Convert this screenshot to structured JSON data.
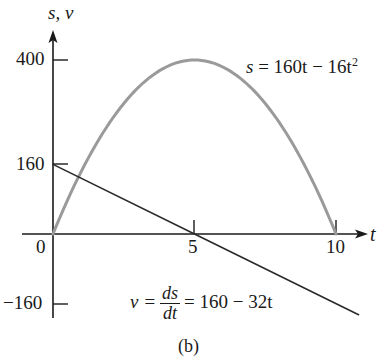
{
  "chart_data": {
    "type": "line",
    "title": "",
    "caption": "(b)",
    "xlabel": "t",
    "ylabel": "s, v",
    "xlim": [
      0,
      11
    ],
    "ylim": [
      -180,
      420
    ],
    "grid": false,
    "x_ticks": [
      0,
      5,
      10
    ],
    "y_ticks": [
      400,
      160,
      0,
      -160
    ],
    "x_tick_labels": [
      "0",
      "5",
      "10"
    ],
    "y_tick_labels": [
      "400",
      "160",
      "-160"
    ],
    "series": [
      {
        "name": "s = 160t - 16t^2",
        "kind": "curve",
        "color": "#9a9a9a",
        "x": [
          0,
          1,
          2,
          3,
          4,
          5,
          6,
          7,
          8,
          9,
          10
        ],
        "values": [
          0,
          144,
          256,
          336,
          384,
          400,
          384,
          336,
          256,
          144,
          0
        ]
      },
      {
        "name": "v = ds/dt = 160 - 32t",
        "kind": "line",
        "color": "#2a2a2a",
        "x": [
          0,
          5,
          10.8
        ],
        "values": [
          160,
          0,
          -185.6
        ]
      }
    ],
    "annotations": [
      {
        "text": "s = 160t - 16t^2",
        "near": "upper right of parabola"
      },
      {
        "text": "v = ds/dt = 160 - 32t",
        "near": "lower middle, below line"
      }
    ]
  },
  "labels": {
    "y_axis": "s, v",
    "x_axis": "t",
    "tick_400": "400",
    "tick_160": "160",
    "tick_0": "0",
    "tick_neg160": "−160",
    "tick_5": "5",
    "tick_10": "10",
    "s_eq_lhs": "s",
    "s_eq_rhs": "= 160t − 16t",
    "s_eq_exp": "2",
    "v_eq_lhs": "v =",
    "v_eq_num": "ds",
    "v_eq_den": "dt",
    "v_eq_rhs": "= 160 − 32t",
    "caption": "(b)"
  },
  "colors": {
    "axis": "#1a1a1a",
    "position_curve": "#9a9a9a",
    "velocity_line": "#2a2a2a"
  }
}
